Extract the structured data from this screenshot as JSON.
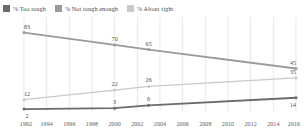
{
  "legend": {
    "position": "top",
    "items": [
      {
        "label": "% Too tough",
        "color": "#6b6b6d",
        "series_key": "too_tough"
      },
      {
        "label": "% Not tough enough",
        "color": "#9a9a9c",
        "series_key": "not_tough_enough"
      },
      {
        "label": "% About right",
        "color": "#c9c9cb",
        "series_key": "about_right"
      }
    ]
  },
  "chart_data": {
    "type": "line",
    "title": "",
    "subtitle": "",
    "xlabel": "",
    "ylabel": "",
    "xlim": [
      1992,
      2016
    ],
    "ylim": [
      0,
      90
    ],
    "grid": "vertical",
    "legend_position": "top",
    "x_ticks": [
      1992,
      1994,
      1996,
      1998,
      2000,
      2002,
      2004,
      2006,
      2008,
      2010,
      2012,
      2014,
      2016
    ],
    "x": [
      1992,
      2000,
      2003,
      2016
    ],
    "series": [
      {
        "name": "% Not tough enough",
        "color": "#9a9a9c",
        "values": [
          83,
          70,
          65,
          45
        ],
        "labels": [
          "83",
          "70",
          "65",
          "45"
        ],
        "label_positions": [
          "above",
          "above",
          "above",
          "above"
        ]
      },
      {
        "name": "% About right",
        "color": "#c9c9cb",
        "values": [
          12,
          22,
          26,
          35
        ],
        "labels": [
          "12",
          "22",
          "26",
          "35"
        ],
        "label_positions": [
          "above",
          "above",
          "above",
          "above"
        ]
      },
      {
        "name": "% Too tough",
        "color": "#6b6b6d",
        "values": [
          2,
          3,
          6,
          14
        ],
        "labels": [
          "2",
          "3",
          "6",
          "14"
        ],
        "label_positions": [
          "below",
          "above",
          "above",
          "below"
        ]
      }
    ]
  }
}
